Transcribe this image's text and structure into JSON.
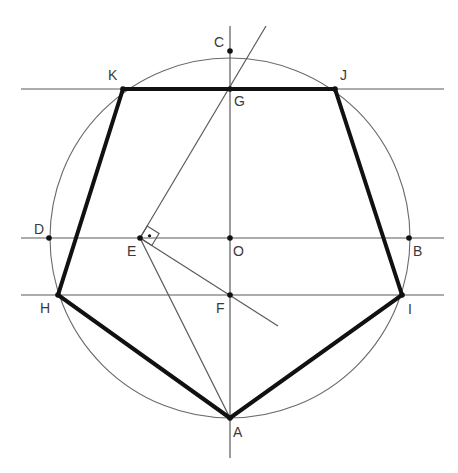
{
  "diagram": {
    "colors": {
      "background": "#ffffff",
      "construction_line": "#5a5a5a",
      "pentagon": "#111111",
      "label": "#3a3a3a"
    },
    "center": {
      "name": "O",
      "x": 230,
      "y": 238
    },
    "radius": 180,
    "points": [
      {
        "name": "C",
        "x": 230,
        "y": 51,
        "lx": 214,
        "ly": 47
      },
      {
        "name": "K",
        "x": 123,
        "y": 89,
        "lx": 108,
        "ly": 80
      },
      {
        "name": "J",
        "x": 335,
        "y": 89,
        "lx": 340,
        "ly": 80
      },
      {
        "name": "G",
        "x": 230,
        "y": 89,
        "lx": 234,
        "ly": 106
      },
      {
        "name": "D",
        "x": 49,
        "y": 238,
        "lx": 34,
        "ly": 234
      },
      {
        "name": "E",
        "x": 140,
        "y": 238,
        "lx": 127,
        "ly": 256
      },
      {
        "name": "O",
        "x": 230,
        "y": 238,
        "lx": 233,
        "ly": 256
      },
      {
        "name": "B",
        "x": 409,
        "y": 238,
        "lx": 413,
        "ly": 256
      },
      {
        "name": "H",
        "x": 58,
        "y": 295,
        "lx": 40,
        "ly": 313
      },
      {
        "name": "F",
        "x": 230,
        "y": 295,
        "lx": 216,
        "ly": 313
      },
      {
        "name": "I",
        "x": 402,
        "y": 295,
        "lx": 408,
        "ly": 314
      },
      {
        "name": "A",
        "x": 230,
        "y": 418,
        "lx": 233,
        "ly": 437
      }
    ],
    "pentagon": [
      "A",
      "H",
      "K",
      "J",
      "I"
    ],
    "lines": [
      {
        "id": "horiz-KJ",
        "x1": 21,
        "y1": 89,
        "x2": 444,
        "y2": 89
      },
      {
        "id": "horiz-DB",
        "x1": 21,
        "y1": 238,
        "x2": 444,
        "y2": 238
      },
      {
        "id": "horiz-HI",
        "x1": 21,
        "y1": 295,
        "x2": 444,
        "y2": 295
      },
      {
        "id": "vertical-CA",
        "x1": 230,
        "y1": 26,
        "x2": 230,
        "y2": 458
      },
      {
        "id": "EG-extended",
        "x1": 140,
        "y1": 238,
        "x2": 266,
        "y2": 26
      },
      {
        "id": "EF-extended",
        "x1": 140,
        "y1": 238,
        "x2": 278,
        "y2": 326
      },
      {
        "id": "EA",
        "x1": 140,
        "y1": 238,
        "x2": 230,
        "y2": 418
      }
    ],
    "right_angle_marker": {
      "at": "E",
      "size": 14
    }
  }
}
